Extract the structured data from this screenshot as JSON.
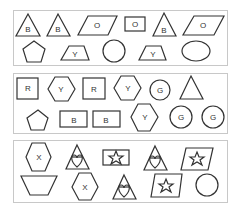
{
  "panels": [
    {
      "name": "panel-1",
      "rows": [
        [
          {
            "shape": "triangle",
            "label": "B"
          },
          {
            "shape": "triangle",
            "label": "B"
          },
          {
            "shape": "parallelogram",
            "label": "O"
          },
          {
            "shape": "rectangle",
            "label": "O"
          },
          {
            "shape": "triangle",
            "label": "B"
          },
          {
            "shape": "parallelogram",
            "label": "O"
          }
        ],
        [
          {
            "shape": "pentagon",
            "label": ""
          },
          {
            "shape": "trapezoid",
            "label": "Y"
          },
          {
            "shape": "circle",
            "label": ""
          },
          {
            "shape": "trapezoid",
            "label": "Y"
          },
          {
            "shape": "ellipse",
            "label": ""
          }
        ]
      ]
    },
    {
      "name": "panel-2",
      "rows": [
        [
          {
            "shape": "square",
            "label": "R"
          },
          {
            "shape": "hexagon",
            "label": "Y"
          },
          {
            "shape": "square",
            "label": "R"
          },
          {
            "shape": "hexagon",
            "label": "Y"
          },
          {
            "shape": "circle",
            "label": "G"
          },
          {
            "shape": "triangle",
            "label": ""
          }
        ],
        [
          {
            "shape": "pentagon",
            "label": ""
          },
          {
            "shape": "rectangle",
            "label": "B"
          },
          {
            "shape": "rectangle",
            "label": "B"
          },
          {
            "shape": "hexagon",
            "label": "Y"
          },
          {
            "shape": "circle",
            "label": "G"
          },
          {
            "shape": "circle",
            "label": "G"
          }
        ]
      ]
    },
    {
      "name": "panel-3",
      "rows": [
        [
          {
            "shape": "hexagon",
            "label": "X"
          },
          {
            "shape": "triangle",
            "symbol": "heart"
          },
          {
            "shape": "rectangle",
            "symbol": "star"
          },
          {
            "shape": "triangle",
            "symbol": "heart"
          },
          {
            "shape": "parallelogram",
            "symbol": "star"
          }
        ],
        [
          {
            "shape": "trapezoid-inverted",
            "label": ""
          },
          {
            "shape": "hexagon",
            "label": "X"
          },
          {
            "shape": "triangle",
            "symbol": "heart"
          },
          {
            "shape": "parallelogram",
            "symbol": "star"
          },
          {
            "shape": "circle",
            "label": ""
          }
        ]
      ]
    }
  ],
  "colors": {
    "stroke": "#333333",
    "panel_border": "#c8c8c8",
    "background": "#ffffff"
  }
}
